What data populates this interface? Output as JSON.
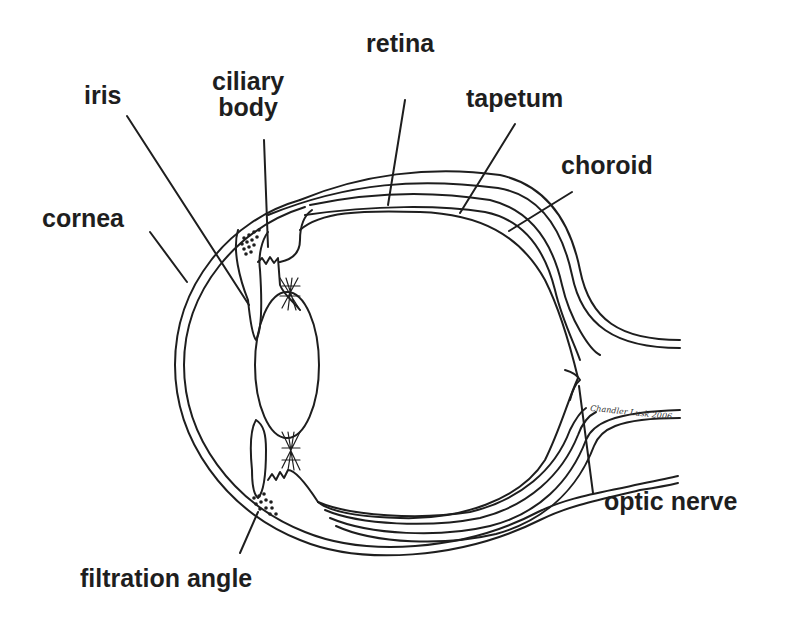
{
  "diagram": {
    "labels": {
      "iris": "iris",
      "ciliary_body_line1": "ciliary",
      "ciliary_body_line2": "body",
      "retina": "retina",
      "tapetum": "tapetum",
      "choroid": "choroid",
      "cornea": "cornea",
      "optic_nerve": "optic nerve",
      "filtration_angle": "filtration angle"
    },
    "signature": "Chandler Lusk 2006",
    "colors": {
      "ink": "#1e1e1e",
      "background": "#ffffff"
    }
  }
}
